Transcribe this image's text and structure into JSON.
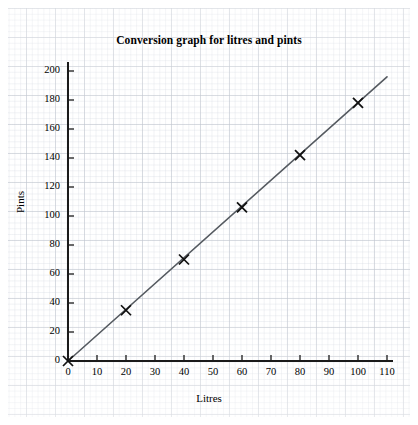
{
  "chart_data": {
    "type": "scatter",
    "title": "Conversion graph for litres and pints",
    "xlabel": "Litres",
    "ylabel": "Pints",
    "xlim": [
      0,
      110
    ],
    "ylim": [
      0,
      200
    ],
    "xticks": [
      "0",
      "10",
      "20",
      "30",
      "40",
      "50",
      "60",
      "70",
      "80",
      "90",
      "100",
      "110"
    ],
    "yticks": [
      "0",
      "20",
      "40",
      "60",
      "80",
      "100",
      "120",
      "140",
      "160",
      "180",
      "200"
    ],
    "xtick_values": [
      0,
      10,
      20,
      30,
      40,
      50,
      60,
      70,
      80,
      90,
      100,
      110
    ],
    "ytick_values": [
      0,
      20,
      40,
      60,
      80,
      100,
      120,
      140,
      160,
      180,
      200
    ],
    "grid": true,
    "grid_style": "graph-paper",
    "legend": null,
    "marker": "x",
    "points": [
      {
        "x": 0,
        "y": 0
      },
      {
        "x": 20,
        "y": 35
      },
      {
        "x": 40,
        "y": 70
      },
      {
        "x": 60,
        "y": 106
      },
      {
        "x": 80,
        "y": 142
      },
      {
        "x": 100,
        "y": 178
      }
    ],
    "series": [
      {
        "name": "litres to pints",
        "x": [
          0,
          20,
          40,
          60,
          80,
          100
        ],
        "values": [
          0,
          35,
          70,
          106,
          142,
          178
        ]
      }
    ],
    "trend_line": {
      "from": {
        "x": 0,
        "y": 0
      },
      "to": {
        "x": 110,
        "y": 196
      },
      "slope": 1.78
    },
    "colors": {
      "axis": "#1a1a1a",
      "line": "#555a60",
      "marker": "#111111",
      "grid_major": "#bec3cd",
      "grid_minor": "#cdd2dc",
      "background": "#ffffff"
    }
  }
}
